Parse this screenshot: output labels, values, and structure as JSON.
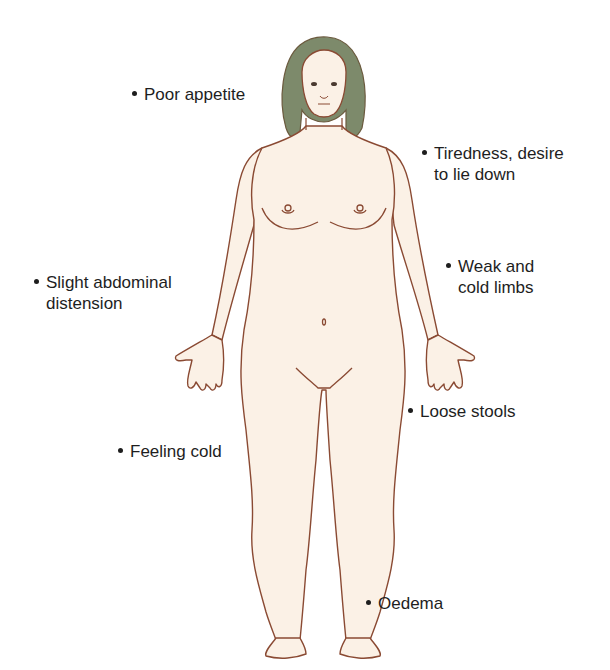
{
  "diagram": {
    "type": "anatomical-figure",
    "colors": {
      "skin": "#fbf1e6",
      "outline": "#8a4a33",
      "hair": "#7d8a6b",
      "text": "#1e1e1e",
      "background": "#ffffff"
    },
    "labels": [
      {
        "id": "poor-appetite",
        "lines": [
          "Poor appetite"
        ]
      },
      {
        "id": "tiredness",
        "lines": [
          "Tiredness, desire",
          "to lie down"
        ]
      },
      {
        "id": "abdominal-distension",
        "lines": [
          "Slight abdominal",
          "distension"
        ]
      },
      {
        "id": "weak-cold-limbs",
        "lines": [
          "Weak and",
          "cold limbs"
        ]
      },
      {
        "id": "loose-stools",
        "lines": [
          "Loose stools"
        ]
      },
      {
        "id": "feeling-cold",
        "lines": [
          "Feeling cold"
        ]
      },
      {
        "id": "oedema",
        "lines": [
          "Oedema"
        ]
      }
    ]
  }
}
